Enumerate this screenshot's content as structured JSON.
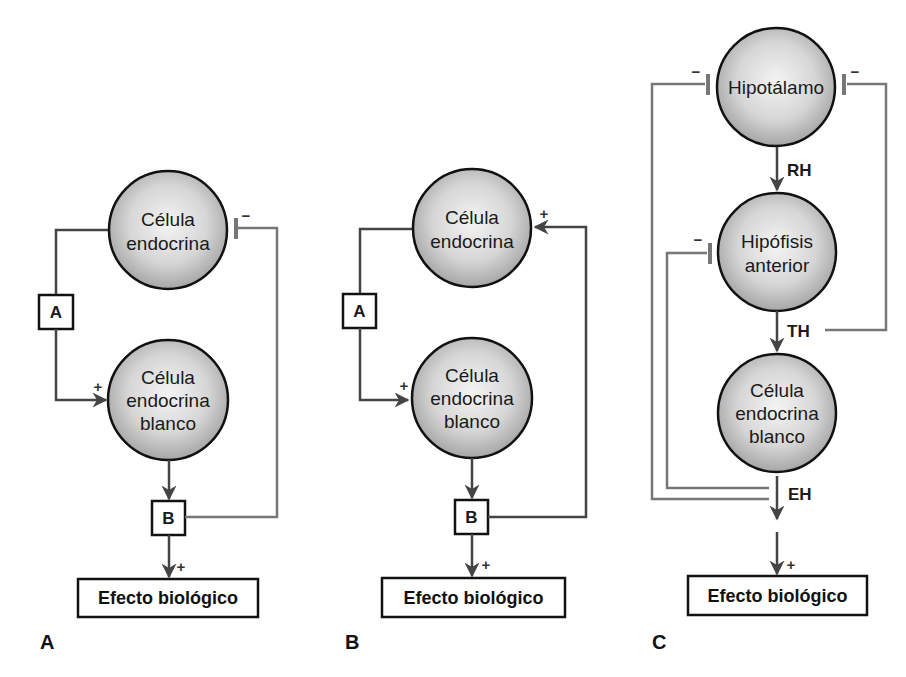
{
  "colors": {
    "cell_fill_center": "#f2f2f2",
    "cell_fill_edge": "#a8a8a8",
    "stroke": "#111111",
    "feedback_line": "#777777",
    "arrow": "#444444"
  },
  "panels": {
    "A": {
      "label": "A",
      "endocrine_cell": [
        "Célula",
        "endocrina"
      ],
      "target_cell": [
        "Célula",
        "endocrina",
        "blanco"
      ],
      "box_a": "A",
      "box_b": "B",
      "effect": "Efecto biológico",
      "sign_target": "+",
      "sign_effect": "+",
      "sign_feedback": "−",
      "feedback_type": "negative"
    },
    "B": {
      "label": "B",
      "endocrine_cell": [
        "Célula",
        "endocrina"
      ],
      "target_cell": [
        "Célula",
        "endocrina",
        "blanco"
      ],
      "box_a": "A",
      "box_b": "B",
      "effect": "Efecto biológico",
      "sign_target": "+",
      "sign_effect": "+",
      "sign_feedback": "+",
      "feedback_type": "positive"
    },
    "C": {
      "label": "C",
      "hypothalamus": "Hipotálamo",
      "pituitary": [
        "Hipófisis",
        "anterior"
      ],
      "target_cell": [
        "Célula",
        "endocrina",
        "blanco"
      ],
      "hormone_rh": "RH",
      "hormone_th": "TH",
      "hormone_eh": "EH",
      "effect": "Efecto biológico",
      "sign_effect": "+",
      "sign_fb_left_hypo": "−",
      "sign_fb_right_hypo": "−",
      "sign_fb_pituitary": "−"
    }
  }
}
